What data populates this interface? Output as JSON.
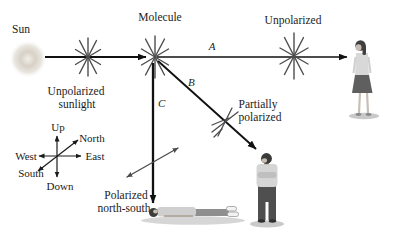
{
  "labels": {
    "sun": "Sun",
    "molecule": "Molecule",
    "unpolarized": "Unpolarized",
    "unpolarized_sunlight": [
      "Unpolarized",
      "sunlight"
    ],
    "ray_a": "A",
    "ray_b": "B",
    "ray_c": "C",
    "partially_polarized": [
      "Partially",
      "polarized"
    ],
    "polarized_north_south": [
      "Polarized",
      "north-south"
    ]
  },
  "compass": {
    "up": "Up",
    "down": "Down",
    "north": "North",
    "south": "South",
    "east": "East",
    "west": "West"
  },
  "colors": {
    "text": "#1b1b1b",
    "beam": "#111111",
    "star": "#4d4d4d",
    "sun_glow": "#d7d1c7",
    "figure_dark": "#4f4f4f",
    "figure_light": "#d5d5d5",
    "skin": "#c8beb4",
    "shadow": "#cccccc"
  }
}
